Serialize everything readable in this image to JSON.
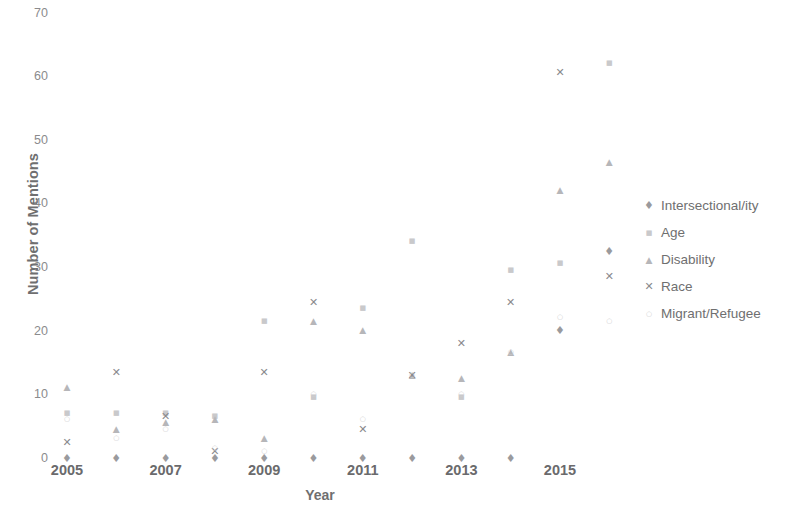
{
  "chart_data": {
    "type": "scatter",
    "title": "",
    "xlabel": "Year",
    "ylabel": "Number of Mentions",
    "xlim": [
      2004.5,
      2016.8
    ],
    "ylim": [
      0,
      70
    ],
    "yticks": [
      0,
      10,
      20,
      30,
      40,
      50,
      60,
      70
    ],
    "xticks": [
      2005,
      2007,
      2009,
      2011,
      2013,
      2015
    ],
    "xtick_labels": [
      "2005",
      "2007",
      "2009",
      "2011",
      "2013",
      "2015"
    ],
    "grid": false,
    "legend_position": "right",
    "x": [
      2005,
      2006,
      2007,
      2008,
      2009,
      2010,
      2011,
      2012,
      2013,
      2014,
      2015,
      2016
    ],
    "series": [
      {
        "name": "Intersectional/ity",
        "marker": "diamond",
        "color": "#9a9a9d",
        "values": [
          0,
          0,
          0,
          0,
          0,
          0,
          0,
          0,
          0,
          0,
          20,
          32.5
        ]
      },
      {
        "name": "Age",
        "marker": "square",
        "color": "#c9c9cb",
        "values": [
          7,
          7,
          7,
          6.5,
          21.5,
          9.5,
          23.5,
          34,
          9.5,
          29.5,
          30.5,
          62
        ]
      },
      {
        "name": "Disability",
        "marker": "triangle",
        "color": "#b6b6b9",
        "values": [
          11,
          4.5,
          5.5,
          6,
          3,
          21.5,
          20,
          13,
          12.5,
          16.5,
          42,
          46.5
        ]
      },
      {
        "name": "Race",
        "marker": "cross",
        "color": "#8a8a8d",
        "values": [
          2.5,
          13.5,
          6.5,
          1,
          13.5,
          24.5,
          4.5,
          13,
          18,
          24.5,
          60.5,
          28.5
        ]
      },
      {
        "name": "Migrant/Refugee",
        "marker": "chevron",
        "color": "#d0d0d2",
        "values": [
          6,
          3,
          4.5,
          1.5,
          1,
          10,
          6,
          13,
          10,
          16.5,
          22,
          21.5
        ]
      }
    ]
  },
  "legend": {
    "items": [
      {
        "label": "Intersectional/ity",
        "glyph": "♦"
      },
      {
        "label": "Age",
        "glyph": "■"
      },
      {
        "label": "Disability",
        "glyph": "▲"
      },
      {
        "label": "Race",
        "glyph": "✕"
      },
      {
        "label": "Migrant/Refugee",
        "glyph": "○"
      }
    ]
  },
  "axes": {
    "y_title": "Number of Mentions",
    "x_title": "Year",
    "y_ticks": [
      "70",
      "60",
      "50",
      "40",
      "30",
      "20",
      "10",
      "0"
    ],
    "x_ticks": [
      "2005",
      "2007",
      "2009",
      "2011",
      "2013",
      "2015"
    ]
  }
}
